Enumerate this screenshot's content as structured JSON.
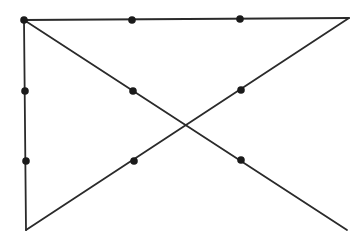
{
  "diagram": {
    "background": "#ffffff",
    "stroke_color": "#2a2a2a",
    "dot_color": "#1a1a1a",
    "dots": [
      {
        "x": 24,
        "y": 20
      },
      {
        "x": 132,
        "y": 20
      },
      {
        "x": 240,
        "y": 19
      },
      {
        "x": 25,
        "y": 91
      },
      {
        "x": 133,
        "y": 91
      },
      {
        "x": 241,
        "y": 90
      },
      {
        "x": 26,
        "y": 161
      },
      {
        "x": 134,
        "y": 161
      },
      {
        "x": 241,
        "y": 160
      }
    ],
    "lines": [
      {
        "x1": 24,
        "y1": 20,
        "x2": 349,
        "y2": 18
      },
      {
        "x1": 349,
        "y1": 18,
        "x2": 26,
        "y2": 230
      },
      {
        "x1": 26,
        "y1": 230,
        "x2": 24,
        "y2": 20
      },
      {
        "x1": 24,
        "y1": 20,
        "x2": 347,
        "y2": 230
      }
    ]
  }
}
